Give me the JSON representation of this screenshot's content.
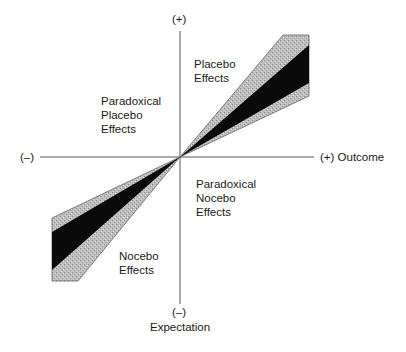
{
  "diagram": {
    "axes": {
      "y_top_label": "(+)",
      "y_bottom_sign": "(–)",
      "y_title": "Expectation",
      "x_left_label": "(–)",
      "x_right_label": "(+) Outcome"
    },
    "regions": {
      "placebo": "Placebo\nEffects",
      "paradoxical_placebo": "Paradoxical\nPlacebo\nEffects",
      "paradoxical_nocebo": "Paradoxical\nNocebo\nEffects",
      "nocebo": "Nocebo\nEffects"
    },
    "colors": {
      "outer_band": "#b9b9b9",
      "inner_band": "#0a0a0a",
      "axis": "#555555"
    }
  }
}
